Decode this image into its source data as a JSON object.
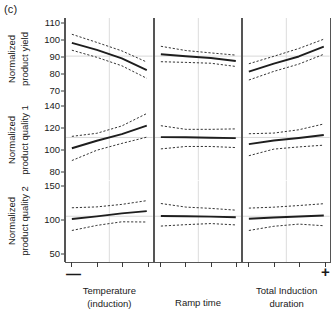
{
  "figure": {
    "caption": "(c)"
  },
  "chart_data": {
    "type": "line",
    "title": "(c)",
    "layout": "3x3 grid of partial dependence plots with 95% confidence bands",
    "grid": false,
    "legend": null,
    "x_extreme_low_label": "—",
    "x_extreme_high_label": "+",
    "xlabel": "",
    "x_factors": [
      {
        "label_line1": "Temperature",
        "label_line2": "(induction)"
      },
      {
        "label_line1": "Ramp time",
        "label_line2": ""
      },
      {
        "label_line1": "Total Induction",
        "label_line2": "duration"
      }
    ],
    "x": [
      0,
      1,
      2,
      3
    ],
    "rows": [
      {
        "ylabel_line1": "Normalized",
        "ylabel_line2": "product yield",
        "ylim": [
          65,
          113
        ],
        "yticks": [
          110,
          100,
          90,
          80,
          70
        ],
        "reference_y": 90.5,
        "panels": [
          {
            "factor": "Temperature (induction)",
            "series": [
              {
                "name": "mean",
                "style": "solid",
                "values": [
                  98.3,
                  94.2,
                  89.2,
                  82.3
                ]
              },
              {
                "name": "upper_ci",
                "style": "dashed",
                "values": [
                  103.4,
                  98.6,
                  93.6,
                  87.0
                ]
              },
              {
                "name": "lower_ci",
                "style": "dashed",
                "values": [
                  94.0,
                  89.8,
                  84.8,
                  77.4
                ]
              }
            ]
          },
          {
            "factor": "Ramp time",
            "series": [
              {
                "name": "mean",
                "style": "solid",
                "values": [
                  91.6,
                  90.4,
                  89.4,
                  87.6
                ]
              },
              {
                "name": "upper_ci",
                "style": "dashed",
                "values": [
                  96.3,
                  93.8,
                  92.4,
                  91.1
                ]
              },
              {
                "name": "lower_ci",
                "style": "dashed",
                "values": [
                  87.2,
                  86.8,
                  86.3,
                  84.4
                ]
              }
            ]
          },
          {
            "factor": "Total Induction duration",
            "series": [
              {
                "name": "mean",
                "style": "solid",
                "values": [
                  81.3,
                  86.1,
                  90.3,
                  96.1
                ]
              },
              {
                "name": "upper_ci",
                "style": "dashed",
                "values": [
                  86.0,
                  90.4,
                  95.0,
                  100.5
                ]
              },
              {
                "name": "lower_ci",
                "style": "dashed",
                "values": [
                  76.4,
                  81.5,
                  85.8,
                  91.6
                ]
              }
            ]
          }
        ]
      },
      {
        "ylabel_line1": "Normalized",
        "ylabel_line2": "product quality 1",
        "ylim": [
          72,
          146
        ],
        "yticks": [
          140,
          120,
          100,
          80
        ],
        "reference_y": 111.0,
        "panels": [
          {
            "factor": "Temperature (induction)",
            "series": [
              {
                "name": "mean",
                "style": "solid",
                "values": [
                  101.2,
                  108.0,
                  114.0,
                  121.8
                ]
              },
              {
                "name": "upper_ci",
                "style": "dashed",
                "values": [
                  112.0,
                  114.8,
                  121.5,
                  132.8
                ]
              },
              {
                "name": "lower_ci",
                "style": "dashed",
                "values": [
                  90.0,
                  99.4,
                  105.6,
                  111.3
                ]
              }
            ]
          },
          {
            "factor": "Ramp time",
            "series": [
              {
                "name": "mean",
                "style": "solid",
                "values": [
                  111.3,
                  111.2,
                  110.8,
                  110.4
                ]
              },
              {
                "name": "upper_ci",
                "style": "dashed",
                "values": [
                  121.7,
                  118.4,
                  118.4,
                  118.8
                ]
              },
              {
                "name": "lower_ci",
                "style": "dashed",
                "values": [
                  100.6,
                  102.8,
                  102.8,
                  101.8
                ]
              }
            ]
          },
          {
            "factor": "Total Induction duration",
            "series": [
              {
                "name": "mean",
                "style": "solid",
                "values": [
                  104.9,
                  108.2,
                  110.5,
                  113.3
                ]
              },
              {
                "name": "upper_ci",
                "style": "dashed",
                "values": [
                  114.4,
                  115.0,
                  118.0,
                  123.3
                ]
              },
              {
                "name": "lower_ci",
                "style": "dashed",
                "values": [
                  94.4,
                  100.4,
                  102.4,
                  104.0
                ]
              }
            ]
          }
        ]
      },
      {
        "ylabel_line1": "Normalized",
        "ylabel_line2": "product quality 2",
        "ylim": [
          38,
          158
        ],
        "yticks": [
          150,
          100,
          50
        ],
        "reference_y": 106.0,
        "panels": [
          {
            "factor": "Temperature (induction)",
            "series": [
              {
                "name": "mean",
                "style": "solid",
                "values": [
                  102.0,
                  105.8,
                  110.2,
                  113.5
                ]
              },
              {
                "name": "upper_ci",
                "style": "dashed",
                "values": [
                  118.5,
                  119.8,
                  123.5,
                  129.0
                ]
              },
              {
                "name": "lower_ci",
                "style": "dashed",
                "values": [
                  85.0,
                  92.5,
                  97.8,
                  97.5
                ]
              }
            ]
          },
          {
            "factor": "Ramp time",
            "series": [
              {
                "name": "mean",
                "style": "solid",
                "values": [
                  106.4,
                  106.0,
                  105.4,
                  104.5
                ]
              },
              {
                "name": "upper_ci",
                "style": "dashed",
                "values": [
                  124.8,
                  119.5,
                  117.6,
                  115.0
                ]
              },
              {
                "name": "lower_ci",
                "style": "dashed",
                "values": [
                  91.5,
                  93.6,
                  95.2,
                  93.2
                ]
              }
            ]
          },
          {
            "factor": "Total Induction duration",
            "series": [
              {
                "name": "mean",
                "style": "solid",
                "values": [
                  102.4,
                  104.2,
                  105.6,
                  107.2
                ]
              },
              {
                "name": "upper_ci",
                "style": "dashed",
                "values": [
                  118.0,
                  119.4,
                  121.8,
                  124.5
                ]
              },
              {
                "name": "lower_ci",
                "style": "dashed",
                "values": [
                  85.0,
                  91.2,
                  94.4,
                  92.0
                ]
              }
            ]
          }
        ]
      }
    ]
  }
}
